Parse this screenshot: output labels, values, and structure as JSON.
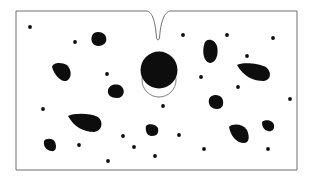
{
  "diagram": {
    "colors": {
      "background": "#ffffff",
      "outline": "#6e6e6e",
      "fill": "#0d0d0d"
    },
    "frame": {
      "x1": 16,
      "y1": 11,
      "x2": 297,
      "y2": 170
    },
    "notch": {
      "left_x": 147,
      "right_x": 170,
      "tip_x": 158,
      "tip_y": 41
    },
    "inclusion": {
      "solid": {
        "cx": 159,
        "cy": 70,
        "r": 18.5
      },
      "outline": {
        "cx": 159,
        "cy": 80,
        "rx": 17,
        "ry": 17
      }
    },
    "particles": [
      {
        "d": "M92,36 C93,31 102,31 105,35 C108,40 106,45 99,46 C93,46 90,41 92,36 Z"
      },
      {
        "d": "M52,67 C53,62 62,62 67,65 C72,70 72,79 66,81 C60,82 54,74 52,67 Z"
      },
      {
        "d": "M108,90 C109,85 116,83 121,86 C126,90 124,98 117,98 C111,98 107,95 108,90 Z"
      },
      {
        "d": "M68,116 C74,113 90,113 98,117 C104,122 102,131 94,132 C84,132 74,127 68,116 Z"
      },
      {
        "d": "M44,141 C46,138 53,138 55,142 C57,147 56,152 51,151 C46,150 43,146 44,141 Z"
      },
      {
        "d": "M146,126 C148,123 156,124 158,128 C159,133 157,136 152,136 C147,136 145,131 146,126 Z"
      },
      {
        "d": "M204,45 C205,38 214,38 217,46 C219,54 216,63 210,63 C204,62 202,53 204,45 Z"
      },
      {
        "d": "M237,65 C242,62 258,63 266,67 C272,72 271,80 264,81 C253,81 244,77 237,65 Z"
      },
      {
        "d": "M209,99 C211,94 219,94 222,98 C225,104 222,110 216,109 C210,108 208,104 209,99 Z"
      },
      {
        "d": "M229,127 C233,123 243,124 247,130 C250,137 249,143 244,143 C237,143 231,137 229,127 Z"
      },
      {
        "d": "M262,122 C265,119 273,120 274,125 C275,130 271,132 268,131 C264,130 262,127 262,122 Z"
      }
    ],
    "dots": [
      [
        30,
        27
      ],
      [
        75,
        42
      ],
      [
        107,
        74
      ],
      [
        43,
        109
      ],
      [
        163,
        106
      ],
      [
        183,
        35
      ],
      [
        227,
        35
      ],
      [
        273,
        38
      ],
      [
        247,
        56
      ],
      [
        201,
        77
      ],
      [
        238,
        87
      ],
      [
        290,
        99
      ],
      [
        123,
        136
      ],
      [
        79,
        145
      ],
      [
        134,
        147
      ],
      [
        179,
        135
      ],
      [
        155,
        156
      ],
      [
        108,
        161
      ],
      [
        204,
        149
      ],
      [
        268,
        149
      ]
    ],
    "dot_radius": 1.9
  }
}
